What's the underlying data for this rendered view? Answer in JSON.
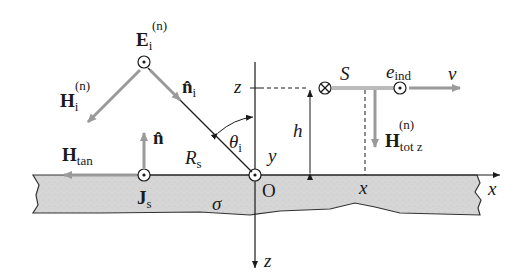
{
  "diagram": {
    "type": "physics-schematic",
    "colors": {
      "background": "#ffffff",
      "conductor_fill": "#d9d9d9",
      "conductor_edge": "#333333",
      "vector_gray": "#9a9a9a",
      "line_dark": "#1a1a1a"
    },
    "labels": {
      "E_incident": {
        "main": "E",
        "sub": "i",
        "sup": "(n)"
      },
      "H_incident": {
        "main": "H",
        "sub": "i",
        "sup": "(n)"
      },
      "n_incident": {
        "main": "n̂",
        "sub": "i"
      },
      "n_normal": {
        "main": "n̂"
      },
      "H_tangential": {
        "main": "H",
        "sub": "tan"
      },
      "J_surface": {
        "main": "J",
        "sub": "s"
      },
      "R_s": {
        "main": "R",
        "sub": "s"
      },
      "sigma": "σ",
      "theta_i": {
        "main": "θ",
        "sub": "i"
      },
      "origin": "O",
      "axis_y": "y",
      "axis_z_top": "z",
      "axis_z_bottom": "z",
      "axis_x": "x",
      "x_mark": "x",
      "height": "h",
      "S_loop": "S",
      "e_ind": {
        "main": "e",
        "sub": "ind"
      },
      "velocity": "v",
      "H_tot_z": {
        "main": "H",
        "sub": "tot z",
        "sup": "(n)"
      }
    }
  }
}
